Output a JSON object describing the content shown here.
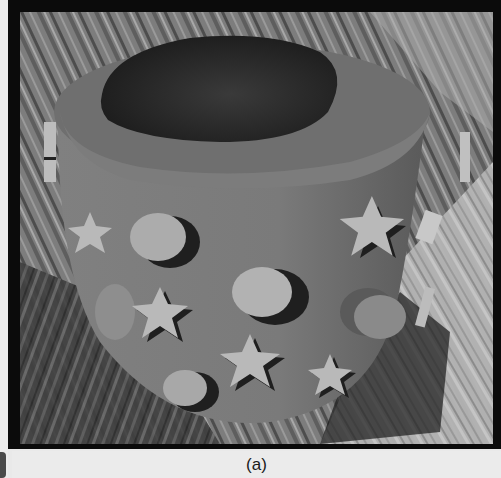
{
  "figure": {
    "caption": "(a)",
    "colors": {
      "frame": "#0b0b0b",
      "background": "#ebebeb",
      "pot_body": "#7a7a7a",
      "pot_rim": "#6e6e6e",
      "pot_interior": "#2a2a2a",
      "shape_light": "#b5b5b5",
      "floor_light": "#b9b9b9",
      "floor_dark": "#4a4a4a"
    },
    "scene": {
      "object": "pot",
      "decorations": [
        "circle",
        "star"
      ],
      "floor": "wood-planks"
    }
  }
}
